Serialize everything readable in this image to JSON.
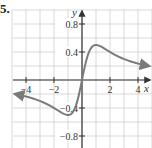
{
  "problem_label": "5.",
  "chart_data": {
    "type": "line",
    "title": "",
    "xlabel": "x",
    "ylabel": "y",
    "xlim": [
      -5,
      5
    ],
    "ylim": [
      -1.0,
      1.0
    ],
    "grid": true,
    "grid_step_x": 1,
    "grid_step_y": 0.2,
    "x_ticks": [
      -4,
      -2,
      2,
      4
    ],
    "x_tick_labels": [
      "−4",
      "−2",
      "2",
      "4"
    ],
    "y_ticks": [
      0.8,
      0.4,
      -0.4,
      -0.8
    ],
    "y_tick_labels": [
      "0.8",
      "0.4",
      "−0.4",
      "−0.8"
    ],
    "series": [
      {
        "name": "f(x)",
        "arrows_at_ends": true,
        "x": [
          -4.8,
          -4,
          -3,
          -2,
          -1.5,
          -1,
          -0.5,
          0,
          0.5,
          1,
          1.5,
          2,
          3,
          4,
          4.8
        ],
        "values": [
          -0.2,
          -0.24,
          -0.3,
          -0.4,
          -0.46,
          -0.5,
          -0.4,
          0.0,
          0.4,
          0.5,
          0.46,
          0.4,
          0.3,
          0.24,
          0.2
        ]
      }
    ],
    "colors": {
      "grid": "#cfcfcf",
      "axis": "#333333",
      "curve": "#7a7a7a"
    }
  }
}
